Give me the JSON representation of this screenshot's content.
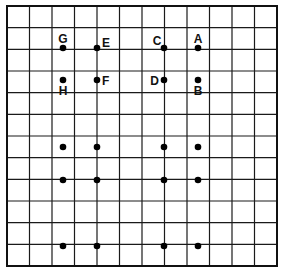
{
  "diagram": {
    "type": "grid-with-points",
    "grid": {
      "columns": 12,
      "rows": 12,
      "left": 7,
      "top": 6,
      "right": 277,
      "bottom": 266,
      "line_color": "#1a1a1a",
      "border_color": "#111111"
    },
    "points": [
      {
        "id": "G",
        "label": "G",
        "x": 63,
        "y": 48,
        "lx": 63,
        "ly": 43,
        "anchor": "middle"
      },
      {
        "id": "E",
        "label": "E",
        "x": 97,
        "y": 48,
        "lx": 102,
        "ly": 47,
        "anchor": "start"
      },
      {
        "id": "C",
        "label": "C",
        "x": 164,
        "y": 48,
        "lx": 157,
        "ly": 45,
        "anchor": "middle"
      },
      {
        "id": "A",
        "label": "A",
        "x": 198,
        "y": 48,
        "lx": 198,
        "ly": 43,
        "anchor": "middle"
      },
      {
        "id": "H",
        "label": "H",
        "x": 63,
        "y": 80,
        "lx": 63,
        "ly": 95,
        "anchor": "middle"
      },
      {
        "id": "F",
        "label": "F",
        "x": 97,
        "y": 80,
        "lx": 102,
        "ly": 85,
        "anchor": "start"
      },
      {
        "id": "D",
        "label": "D",
        "x": 164,
        "y": 80,
        "lx": 159,
        "ly": 85,
        "anchor": "end"
      },
      {
        "id": "B",
        "label": "B",
        "x": 198,
        "y": 80,
        "lx": 198,
        "ly": 95,
        "anchor": "middle"
      },
      {
        "id": "p9",
        "label": "",
        "x": 63,
        "y": 147
      },
      {
        "id": "p10",
        "label": "",
        "x": 97,
        "y": 147
      },
      {
        "id": "p11",
        "label": "",
        "x": 164,
        "y": 147
      },
      {
        "id": "p12",
        "label": "",
        "x": 198,
        "y": 147
      },
      {
        "id": "p13",
        "label": "",
        "x": 63,
        "y": 180
      },
      {
        "id": "p14",
        "label": "",
        "x": 97,
        "y": 180
      },
      {
        "id": "p15",
        "label": "",
        "x": 164,
        "y": 180
      },
      {
        "id": "p16",
        "label": "",
        "x": 198,
        "y": 180
      },
      {
        "id": "p17",
        "label": "",
        "x": 63,
        "y": 246
      },
      {
        "id": "p18",
        "label": "",
        "x": 97,
        "y": 246
      },
      {
        "id": "p19",
        "label": "",
        "x": 164,
        "y": 246
      },
      {
        "id": "p20",
        "label": "",
        "x": 198,
        "y": 246
      }
    ],
    "labels": {
      "A": "A",
      "B": "B",
      "C": "C",
      "D": "D",
      "E": "E",
      "F": "F",
      "G": "G",
      "H": "H"
    },
    "dot_color": "#000000",
    "dot_radius": 3.3
  }
}
